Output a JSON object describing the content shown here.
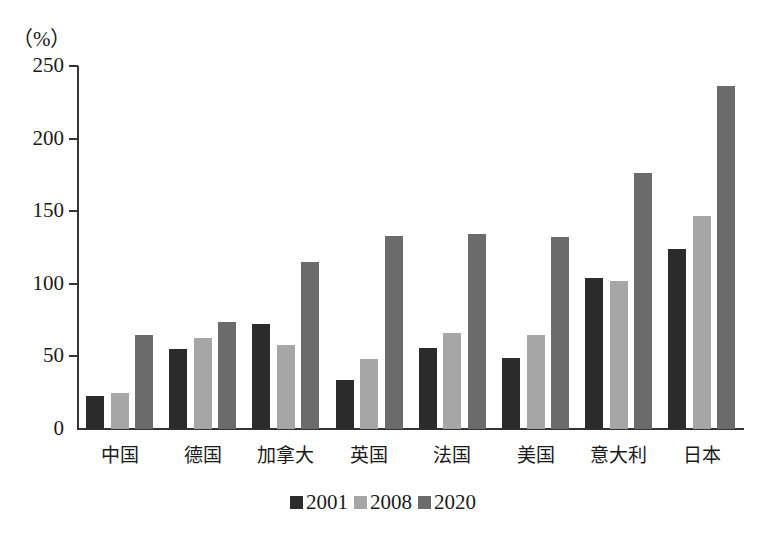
{
  "chart_data": {
    "type": "bar",
    "title": "",
    "unit_label": "（%）",
    "xlabel": "",
    "ylabel": "（%）",
    "ylim": [
      0,
      250
    ],
    "yticks": [
      0,
      50,
      100,
      150,
      200,
      250
    ],
    "grid": false,
    "legend_position": "bottom",
    "categories": [
      "中国",
      "德国",
      "加拿大",
      "英国",
      "法国",
      "美国",
      "意大利",
      "日本"
    ],
    "series": [
      {
        "name": "2001",
        "color": "#2b2b2b",
        "values": [
          23,
          55,
          72,
          34,
          56,
          49,
          104,
          124
        ]
      },
      {
        "name": "2008",
        "color": "#a6a6a6",
        "values": [
          25,
          63,
          58,
          48,
          66,
          65,
          102,
          147
        ]
      },
      {
        "name": "2020",
        "color": "#6b6b6b",
        "values": [
          65,
          74,
          115,
          133,
          134,
          132,
          176,
          236
        ]
      }
    ]
  }
}
